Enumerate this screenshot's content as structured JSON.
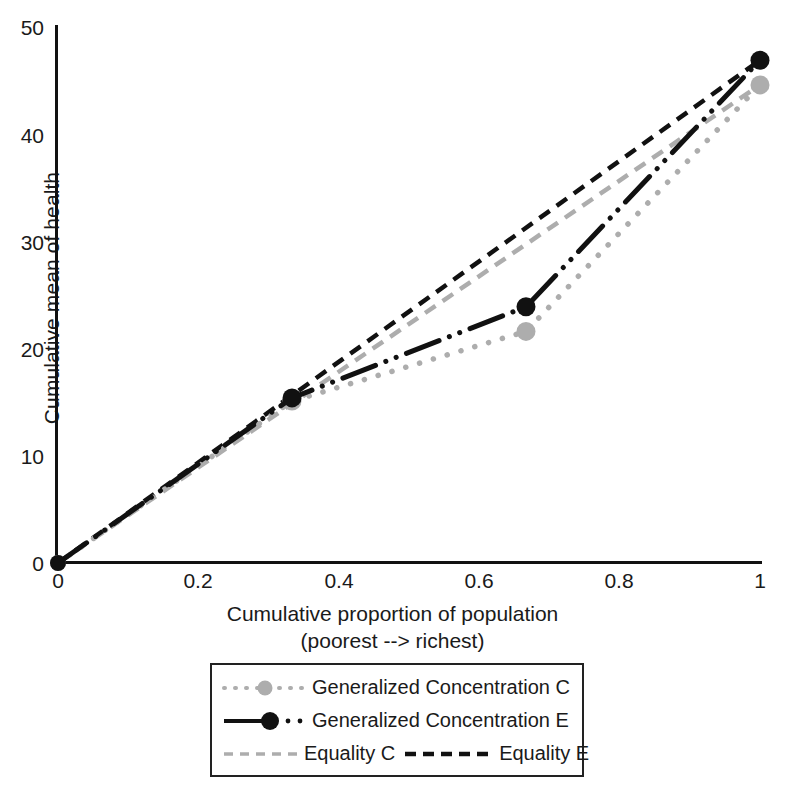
{
  "chart_data": {
    "type": "line",
    "title": "",
    "xlabel": "Cumulative proportion of population",
    "xlabel_line2": "(poorest --> richest)",
    "ylabel": "Cumulative mean of health",
    "xlim": [
      0,
      1
    ],
    "ylim": [
      0,
      50
    ],
    "xticks": [
      "0",
      "0.2",
      "0.4",
      "0.6",
      "0.8",
      "1"
    ],
    "xtick_values": [
      0,
      0.2,
      0.4,
      0.6,
      0.8,
      1
    ],
    "yticks": [
      "0",
      "10",
      "20",
      "30",
      "40",
      "50"
    ],
    "ytick_values": [
      0,
      10,
      20,
      30,
      40,
      50
    ],
    "grid": false,
    "legend_position": "below-center",
    "series": [
      {
        "name": "Generalized Concentration C",
        "style": "dotted",
        "color": "#adadad",
        "marker": "circle",
        "x": [
          0,
          0.3333,
          0.6667,
          1
        ],
        "values": [
          0,
          15.1,
          21.6,
          44.6
        ]
      },
      {
        "name": "Generalized Concentration E",
        "style": "dash-dot-dot",
        "color": "#111111",
        "marker": "circle",
        "x": [
          0,
          0.3333,
          0.6667,
          1
        ],
        "values": [
          0,
          15.4,
          23.9,
          46.9
        ]
      },
      {
        "name": "Equality C",
        "style": "dashed",
        "color": "#adadad",
        "marker": "none",
        "x": [
          0,
          1
        ],
        "values": [
          0,
          44.6
        ]
      },
      {
        "name": "Equality E",
        "style": "dashed",
        "color": "#111111",
        "marker": "none",
        "x": [
          0,
          1
        ],
        "values": [
          0,
          46.9
        ]
      }
    ]
  },
  "legend": {
    "rows": [
      {
        "label": "Generalized Concentration C"
      },
      {
        "label": "Generalized Concentration E"
      },
      {
        "label_a": "Equality C",
        "label_b": "Equality E"
      }
    ]
  },
  "axes": {
    "ytick_0": "0",
    "ytick_10": "10",
    "ytick_20": "20",
    "ytick_30": "30",
    "ytick_40": "40",
    "ytick_50": "50",
    "xtick_0": "0",
    "xtick_1": "0.2",
    "xtick_2": "0.4",
    "xtick_3": "0.6",
    "xtick_4": "0.8",
    "xtick_5": "1"
  }
}
